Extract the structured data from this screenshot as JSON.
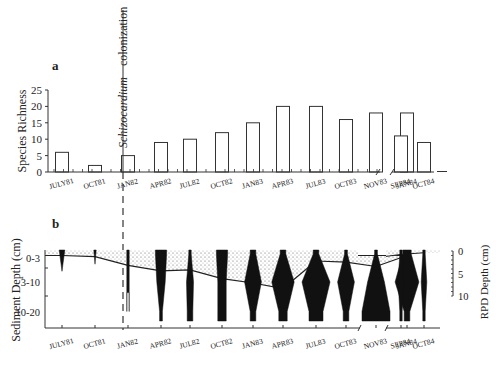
{
  "chart_data": [
    {
      "panel": "a",
      "type": "bar",
      "ylabel": "Species Richness",
      "ylim": [
        0,
        25
      ],
      "yticks": [
        0,
        5,
        10,
        15,
        20,
        25
      ],
      "categories": [
        "JULY81",
        "OCT81",
        "JAN82",
        "APR82",
        "JUL82",
        "OCT82",
        "JAN83",
        "APR83",
        "JUL83",
        "OCT83",
        "NOV83",
        "JAN84",
        "SEP84",
        "OCT84"
      ],
      "values": [
        6,
        2,
        5,
        9,
        10,
        12,
        15,
        20,
        20,
        16,
        18,
        18,
        11,
        9
      ],
      "axis_break_after": "JAN84",
      "annotation": {
        "text_italic": "Schizocardium",
        "text": "colonization",
        "between": [
          "JAN82",
          "APR82"
        ]
      }
    },
    {
      "panel": "b",
      "type": "area",
      "ylabel": "Sediment Depth (cm)",
      "ytick_labels": [
        "0-3",
        "3-10",
        "10-20"
      ],
      "y2label": "RPD Depth (cm)",
      "y2ticks": [
        0,
        5,
        10
      ],
      "categories": [
        "JULY81",
        "OCT81",
        "JAN82",
        "APR82",
        "JUL82",
        "OCT82",
        "JAN83",
        "APR83",
        "JUL83",
        "OCT83",
        "NOV83",
        "JAN84",
        "SEP84",
        "OCT84"
      ],
      "rpd_depth_cm": [
        1.0,
        1.2,
        2.8,
        3.8,
        3.6,
        5.2,
        6.0,
        7.0,
        2.0,
        2.2,
        3.0,
        1.0,
        0.8,
        0.5
      ],
      "kite_profiles": [
        {
          "label": "JULY81",
          "widths": [
            0.2,
            0.0,
            0.0
          ],
          "depth_reach": 0.3
        },
        {
          "label": "OCT81",
          "widths": [
            0.02,
            0.0,
            0.0
          ],
          "depth_reach": 0.2
        },
        {
          "label": "JAN82",
          "widths": [
            0.05,
            0.05,
            0.0
          ],
          "depth_reach": 0.6
        },
        {
          "label": "APR82",
          "widths": [
            0.4,
            0.3,
            0.1
          ],
          "depth_reach": 1.0
        },
        {
          "label": "JUL82",
          "widths": [
            0.08,
            0.25,
            0.2
          ],
          "depth_reach": 1.0
        },
        {
          "label": "OCT82",
          "widths": [
            0.4,
            0.3,
            0.3
          ],
          "depth_reach": 1.0
        },
        {
          "label": "JAN83",
          "widths": [
            0.2,
            0.6,
            0.2
          ],
          "depth_reach": 1.0
        },
        {
          "label": "APR83",
          "widths": [
            0.2,
            0.8,
            0.3
          ],
          "depth_reach": 1.0
        },
        {
          "label": "JUL83",
          "widths": [
            0.2,
            1.0,
            0.5
          ],
          "depth_reach": 1.0
        },
        {
          "label": "OCT83",
          "widths": [
            0.1,
            0.6,
            0.2
          ],
          "depth_reach": 1.0
        },
        {
          "label": "NOV83",
          "widths": [
            0.1,
            0.6,
            1.0
          ],
          "depth_reach": 1.0
        },
        {
          "label": "JAN84",
          "widths": [
            0.3,
            0.85,
            0.2
          ],
          "depth_reach": 1.0
        },
        {
          "label": "SEP84",
          "widths": [
            0.02,
            0.2,
            0.02
          ],
          "depth_reach": 1.0
        },
        {
          "label": "OCT84",
          "widths": [
            0.02,
            0.2,
            0.02
          ],
          "depth_reach": 1.0
        }
      ]
    }
  ],
  "labels": {
    "panel_a": "a",
    "panel_b": "b",
    "colonization_italic": "Schizocardium",
    "colonization": "colonization"
  }
}
